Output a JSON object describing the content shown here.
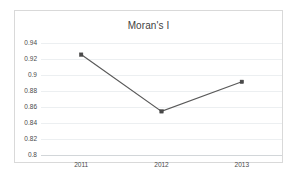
{
  "chart_data": {
    "type": "line",
    "title": "Moran's I",
    "xlabel": "",
    "ylabel": "",
    "categories": [
      "2011",
      "2012",
      "2013"
    ],
    "values": [
      0.9255,
      0.8545,
      0.8915
    ],
    "series": [
      {
        "name": "Moran's I",
        "values": [
          0.9255,
          0.8545,
          0.8915
        ]
      }
    ],
    "ylim": [
      0.8,
      0.94
    ],
    "ytick_labels": [
      "0.94",
      "0.92",
      "0.9",
      "0.88",
      "0.86",
      "0.84",
      "0.82",
      "0.8"
    ],
    "ytick_values": [
      0.94,
      0.92,
      0.9,
      0.88,
      0.86,
      0.84,
      0.82,
      0.8
    ],
    "ytick_interval": 0.02,
    "grid": true,
    "legend": false,
    "legend_position": "none",
    "marker": "square",
    "line_color": "#595959",
    "marker_color": "#4a4a4a",
    "gridline_color": "#eceff1",
    "axis_color": "#d2d6d9",
    "border_color": "#d9d9d9",
    "background_color": "#ffffff",
    "text_color": "#4a4a4a",
    "title_color": "#3f3f3f"
  }
}
